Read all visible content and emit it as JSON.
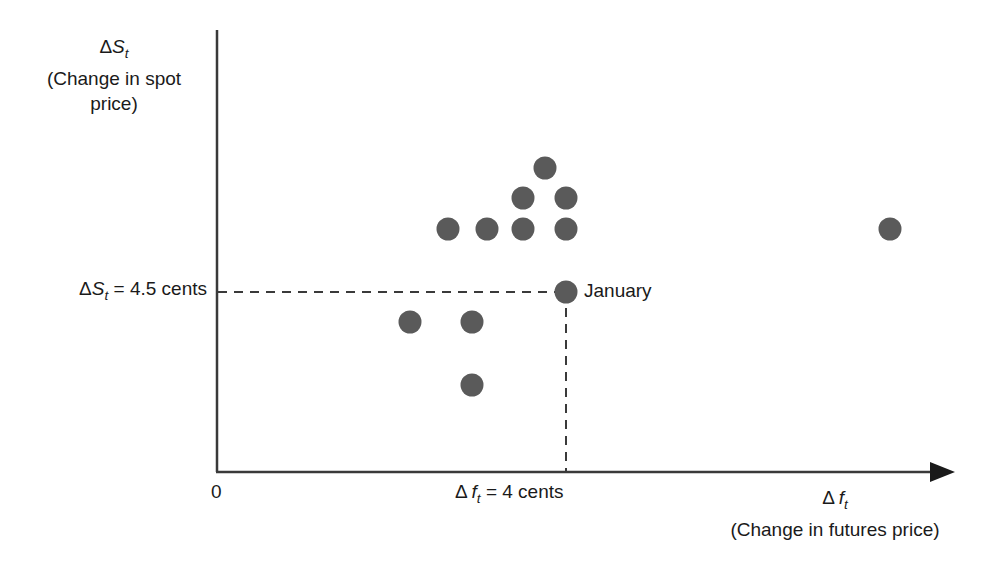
{
  "chart_data": {
    "type": "scatter",
    "title": "",
    "xlabel": "(Change in futures price)",
    "xlabel_symbol": "Δ f",
    "xlabel_symbol_sub": "t",
    "ylabel": "(Change in spot price)",
    "ylabel_symbol": "ΔS",
    "ylabel_symbol_sub": "t",
    "origin_label": "0",
    "grid": false,
    "legend": null,
    "xlim": [
      0,
      10
    ],
    "ylim": [
      0,
      10
    ],
    "reference_lines": {
      "y_value_label": "= 4.5 cents",
      "y_value_symbol": "ΔS",
      "y_value_symbol_sub": "t",
      "y_value": 4.5,
      "x_value_label": "= 4 cents",
      "x_value_symbol": "Δ f",
      "x_value_symbol_sub": "t",
      "x_value": 4,
      "style": "dashed"
    },
    "annotations": [
      {
        "text": "January",
        "x": 4,
        "y": 4.5
      }
    ],
    "point_color": "#5a5a5a",
    "axis_color": "#3a3a3a",
    "points": [
      {
        "px": 448,
        "py": 229
      },
      {
        "px": 487,
        "py": 229
      },
      {
        "px": 523,
        "py": 229
      },
      {
        "px": 566,
        "py": 229
      },
      {
        "px": 523,
        "py": 198
      },
      {
        "px": 566,
        "py": 198
      },
      {
        "px": 545,
        "py": 168
      },
      {
        "px": 890,
        "py": 229
      },
      {
        "px": 410,
        "py": 322
      },
      {
        "px": 472,
        "py": 322
      },
      {
        "px": 472,
        "py": 385
      },
      {
        "px": 566,
        "py": 292
      }
    ]
  }
}
